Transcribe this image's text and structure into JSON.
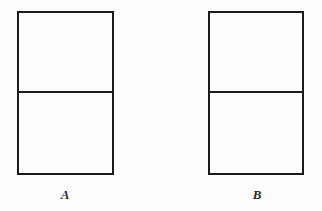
{
  "figure": {
    "background_color": "#fdfdfd",
    "stroke_color": "#1c1c1c",
    "caption_color": "#2a2a2a",
    "panels": [
      {
        "id": "panel-a",
        "label": "A",
        "label_style": "italic-serif",
        "rect": {
          "x": 17,
          "y": 11,
          "width": 97,
          "height": 164
        },
        "border_width": 2,
        "divider": {
          "name": "horizontal-divider",
          "y": 92,
          "x_start": 17,
          "x_end": 114,
          "width": 2,
          "fraction_from_top": 0.494
        },
        "label_position": {
          "x": 65,
          "y": 198
        }
      },
      {
        "id": "panel-b",
        "label": "B",
        "label_style": "italic-serif",
        "rect": {
          "x": 208,
          "y": 11,
          "width": 96,
          "height": 164
        },
        "border_width": 2,
        "divider": {
          "name": "horizontal-divider",
          "y": 92,
          "x_start": 208,
          "x_end": 304,
          "width": 2,
          "fraction_from_top": 0.494
        },
        "label_position": {
          "x": 257,
          "y": 198
        }
      }
    ]
  },
  "canvas": {
    "width": 322,
    "height": 211
  }
}
